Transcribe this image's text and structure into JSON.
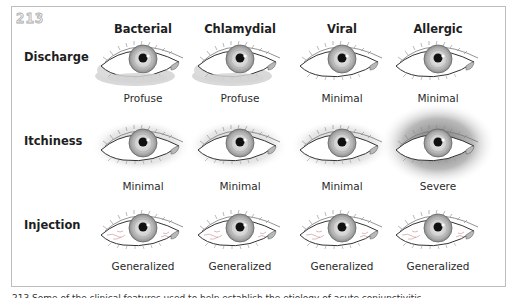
{
  "figure": {
    "number": "213",
    "caption": "213 Some of the clinical features used to help establish the etiology of acute conjunctivitis."
  },
  "columns": [
    {
      "label": "Bacterial",
      "x": 143
    },
    {
      "label": "Chlamydial",
      "x": 240
    },
    {
      "label": "Viral",
      "x": 342
    },
    {
      "label": "Allergic",
      "x": 438
    }
  ],
  "rows": [
    {
      "label": "Discharge",
      "values": [
        "Profuse",
        "Profuse",
        "Minimal",
        "Minimal"
      ],
      "variants": [
        "discharge",
        "discharge",
        "plain",
        "plain"
      ]
    },
    {
      "label": "Itchiness",
      "values": [
        "Minimal",
        "Minimal",
        "Minimal",
        "Severe"
      ],
      "variants": [
        "halo-light",
        "halo-light",
        "halo-light",
        "halo-severe"
      ]
    },
    {
      "label": "Injection",
      "values": [
        "Generalized",
        "Generalized",
        "Generalized",
        "Generalized"
      ],
      "variants": [
        "vessels",
        "vessels",
        "vessels",
        "vessels"
      ]
    }
  ],
  "colors": {
    "border": "#bdbdbd",
    "iris_outer": "#9a9a9a",
    "iris_inner": "#d6d6d6",
    "pupil": "#111111",
    "discharge": "#d9d9d9",
    "vessels": "#c98a8a"
  }
}
